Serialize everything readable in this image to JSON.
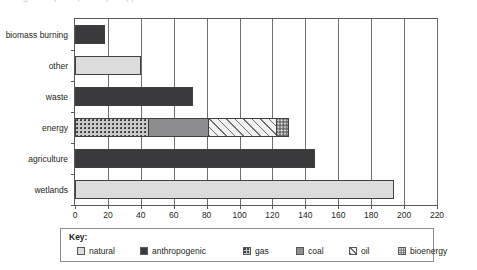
{
  "top_caption": "…  figure caption partially cropped  …",
  "chart_data": {
    "type": "bar",
    "orientation": "horizontal",
    "title": "",
    "xlabel": "",
    "ylabel": "",
    "xlim": [
      0,
      220
    ],
    "xticks": [
      0,
      20,
      40,
      60,
      80,
      100,
      120,
      140,
      160,
      180,
      200,
      220
    ],
    "xtick_labels": [
      "0",
      "20",
      "40",
      "60",
      "80",
      "100",
      "120",
      "140",
      "160",
      "180",
      "200",
      "220"
    ],
    "grid": true,
    "grid_axis": "x",
    "legend_position": "bottom",
    "categories": [
      "biomass burning",
      "other",
      "waste",
      "energy",
      "agriculture",
      "wetlands"
    ],
    "series": [
      {
        "name": "natural",
        "key": "natural",
        "color": "#dcdcdc",
        "pattern": "solid-light"
      },
      {
        "name": "anthropogenic",
        "key": "anthropogenic",
        "color": "#3a3a3c",
        "pattern": "solid-dark"
      },
      {
        "name": "gas",
        "key": "gas",
        "color": "#c9c9c9",
        "pattern": "dotted"
      },
      {
        "name": "coal",
        "key": "coal",
        "color": "#8d8d8f",
        "pattern": "solid-mid"
      },
      {
        "name": "oil",
        "key": "oil",
        "color": "#f2f2f2",
        "pattern": "diagonal-hatch"
      },
      {
        "name": "bioenergy",
        "key": "bioenergy",
        "color": "#6e6e70",
        "pattern": "dense-dotted"
      }
    ],
    "bars": [
      {
        "category": "biomass burning",
        "total": 18,
        "segments": [
          {
            "series": "anthropogenic",
            "value": 18
          }
        ]
      },
      {
        "category": "other",
        "total": 40,
        "segments": [
          {
            "series": "natural",
            "value": 40
          }
        ]
      },
      {
        "category": "waste",
        "total": 72,
        "segments": [
          {
            "series": "anthropogenic",
            "value": 72
          }
        ]
      },
      {
        "category": "energy",
        "total": 132,
        "segments": [
          {
            "series": "gas",
            "value": 45
          },
          {
            "series": "coal",
            "value": 37
          },
          {
            "series": "oil",
            "value": 42
          },
          {
            "series": "bioenergy",
            "value": 8
          }
        ]
      },
      {
        "category": "agriculture",
        "total": 146,
        "segments": [
          {
            "series": "anthropogenic",
            "value": 146
          }
        ]
      },
      {
        "category": "wetlands",
        "total": 194,
        "segments": [
          {
            "series": "natural",
            "value": 194
          }
        ]
      }
    ]
  },
  "legend": {
    "title": "Key:",
    "items": [
      {
        "label": "natural",
        "key": "natural"
      },
      {
        "label": "anthropogenic",
        "key": "anthropogenic"
      },
      {
        "label": "gas",
        "key": "gas"
      },
      {
        "label": "coal",
        "key": "coal"
      },
      {
        "label": "oil",
        "key": "oil"
      },
      {
        "label": "bioenergy",
        "key": "bioenergy"
      }
    ]
  }
}
